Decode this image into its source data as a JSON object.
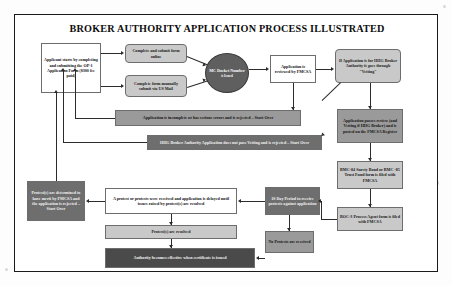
{
  "document": {
    "title": "BROKER AUTHORITY APPLICATION PROCESS ILLUSTRATED"
  },
  "nodes": {
    "applicant_start": "Applicant starts by completing and submitting the OP-1 Application Form ($300 fee paid)",
    "complete_online": "Complete and submit form online",
    "complete_mail": "Complete form manually submit via US Mail",
    "mc_docket": "MC Docket Number",
    "mc_docket_sub": "is Issued",
    "app_reviewed": "Application is reviewed by FMCSA",
    "hhg_vetting": "If Application is for HHG Broker Authority it goes through \"Vetting\"",
    "app_incomplete": "Application is incomplete or has serious errors and is rejected – Start Over",
    "hhg_rejected": "HHG Broker Authority Application does not pass Vetting and is rejected – Start Over",
    "app_passes": "Application passes review (and Vetting if HHG Broker) and is posted on the FMCSA Register",
    "bmc_surety": "BMC-84 Surety Bond or BMC -85 Trust Fund form is filed with FMCSA",
    "boc3": "BOC-3 Process Agent form is filed with FMCSA",
    "ten_day": "10 Day Period to receive protests against application",
    "protest_received": "A protest or protests were received and application is delayed until issues raised by protest(s) are resolved",
    "protest_merit": "Protest(s) are determined to have merit by FMCSA and the application is rejected – Start Over",
    "protest_resolved": "Protest(s) are resolved",
    "no_protests": "No Protests are received",
    "authority_effective": "Authority becomes effective when certificate is issued"
  },
  "colors": {
    "page_background": "#ffffff",
    "border": "#1a1a1a",
    "node_light": "#c9c9c9",
    "node_medium": "#9a9a9a",
    "node_dark": "#6e6e6e",
    "node_extra_dark": "#4a4a4a",
    "connector": "#2b2b2b"
  }
}
